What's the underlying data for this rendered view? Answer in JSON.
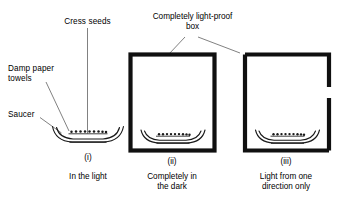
{
  "figure": {
    "title_label_cress": "Cress seeds",
    "label_damp_paper": "Damp paper\ntowels",
    "label_saucer": "Saucer",
    "label_lightproof_box": "Completely light-proof\nbox"
  },
  "panels": [
    {
      "numeral": "(i)",
      "caption": "In the light",
      "box": "none",
      "seed_count": 9
    },
    {
      "numeral": "(ii)",
      "caption": "Completely in\nthe dark",
      "box": "closed",
      "seed_count": 9
    },
    {
      "numeral": "(iii)",
      "caption": "Light from one\ndirection only",
      "box": "slit-right",
      "seed_count": 9
    }
  ],
  "colors": {
    "ink": "#000000",
    "background": "#ffffff",
    "box_stroke": "#111111",
    "leader_line": "#555555"
  }
}
